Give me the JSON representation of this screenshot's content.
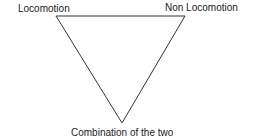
{
  "diagram": {
    "type": "inverted-triangle",
    "labels": {
      "top_left": "Locomotion",
      "top_right": "Non Locomotion",
      "bottom": "Combination of the two"
    },
    "vertices": {
      "top_left": [
        56,
        16
      ],
      "top_right": [
        185,
        16
      ],
      "bottom": [
        122,
        123
      ]
    },
    "stroke_color": "#333333"
  }
}
